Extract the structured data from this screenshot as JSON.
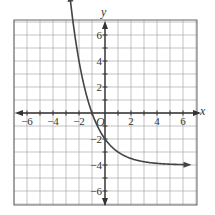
{
  "chart_data": {
    "type": "line",
    "title": "",
    "xlabel": "x",
    "ylabel": "y",
    "origin_label": "O",
    "xlim": [
      -7,
      7
    ],
    "ylim": [
      -7,
      7
    ],
    "grid": true,
    "x_tick_labels": [
      "-6",
      "-4",
      "-2",
      "2",
      "4",
      "6"
    ],
    "y_tick_labels": [
      "6",
      "4",
      "2",
      "-2",
      "-4",
      "-6"
    ],
    "series": [
      {
        "name": "f(x)",
        "equation": "y = 2(1/2)^x - 4",
        "x": [
          -2.7,
          -2,
          -1,
          0,
          1,
          2,
          3,
          4,
          5,
          6.5
        ],
        "values": [
          9.0,
          4,
          0,
          -2,
          -3,
          -3.5,
          -3.75,
          -3.875,
          -3.94,
          -3.98
        ],
        "asymptote_y": -4,
        "arrows": "both"
      }
    ],
    "color": "#444444"
  }
}
